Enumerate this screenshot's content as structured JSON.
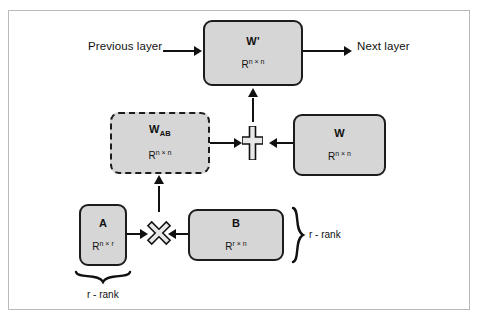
{
  "figure": {
    "type": "block-diagram",
    "topic": "LoRA low-rank adaptation of a weight matrix",
    "background_color": "#ffffff",
    "frame_border_color": "#b9b9bd",
    "node_fill_color": "#d6d6d6",
    "node_border_color": "#1c1c1c",
    "line_color": "#111111"
  },
  "nodes": {
    "w_prime": {
      "name": "W'",
      "base": "W",
      "prime": "'",
      "dims": "R",
      "dims_sup": "n × n",
      "border_style": "solid"
    },
    "w_ab": {
      "name": "WAB",
      "base": "W",
      "subscript": "AB",
      "dims": "R",
      "dims_sup": "n × n",
      "border_style": "dashed"
    },
    "w": {
      "name": "W",
      "base": "W",
      "dims": "R",
      "dims_sup": "n × n",
      "border_style": "solid"
    },
    "a": {
      "name": "A",
      "base": "A",
      "dims": "R",
      "dims_sup": "n × r",
      "border_style": "solid"
    },
    "b": {
      "name": "B",
      "base": "B",
      "dims": "R",
      "dims_sup": "r × n",
      "border_style": "solid"
    }
  },
  "operators": {
    "add": {
      "glyph": "+",
      "semantic": "plus-operator"
    },
    "multiply": {
      "glyph": "×",
      "semantic": "multiply-operator"
    }
  },
  "labels": {
    "previous_layer": "Previous layer",
    "next_layer": "Next layer",
    "rank_right": "r - rank",
    "rank_bottom": "r - rank"
  },
  "ghost_text": {
    "line1": "",
    "line2": "",
    "line3": ""
  }
}
